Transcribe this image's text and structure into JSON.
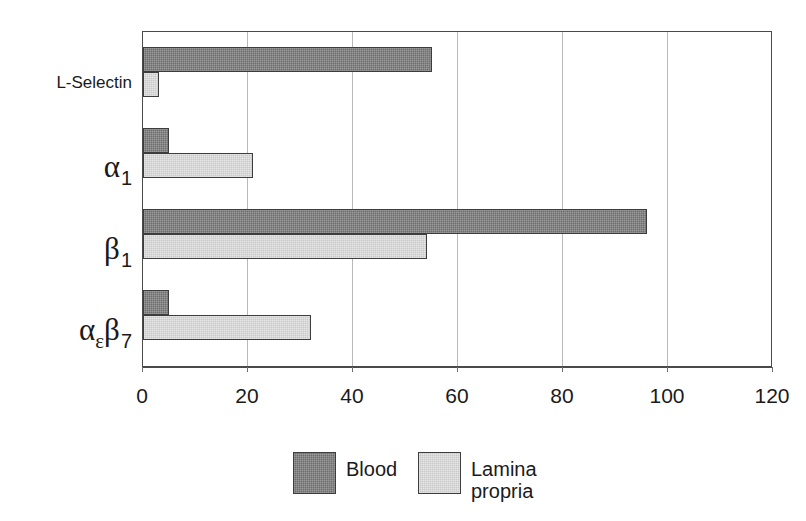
{
  "chart_data": {
    "type": "bar",
    "orientation": "horizontal",
    "title": "",
    "subtitle": "",
    "xlabel": "",
    "ylabel": "",
    "xlim": [
      0,
      120
    ],
    "xticks": [
      0,
      20,
      40,
      60,
      80,
      100,
      120
    ],
    "xtick_labels": [
      "0",
      "20",
      "40",
      "60",
      "80",
      "100",
      "120"
    ],
    "grid": "vertical",
    "legend_position": "bottom-center",
    "categories": [
      "L-Selectin",
      "α₁",
      "β₁",
      "αεβ₇"
    ],
    "category_labels_display": [
      {
        "base": "L-Selectin",
        "sub": "",
        "style": "plain"
      },
      {
        "base": "α",
        "sub": "1",
        "style": "greek"
      },
      {
        "base": "β",
        "sub": "1",
        "style": "greek"
      },
      {
        "base": "α",
        "sub": "ε",
        "base2": "β",
        "sub2": "7",
        "style": "greek-double"
      }
    ],
    "series": [
      {
        "name": "Blood",
        "color": "#6e6e6e",
        "values": [
          55,
          5,
          96,
          5
        ]
      },
      {
        "name": "Lamina propria",
        "color": "#c9c9c9",
        "values": [
          3,
          21,
          54,
          32
        ]
      }
    ]
  },
  "axis": {
    "tick_labels": [
      "0",
      "20",
      "40",
      "60",
      "80",
      "100",
      "120"
    ]
  },
  "legend": {
    "entries": [
      {
        "label": "Blood",
        "color": "#6e6e6e"
      },
      {
        "label": "Lamina\npropria",
        "color": "#c9c9c9"
      }
    ],
    "blood_label": "Blood",
    "lamina_label": "Lamina\npropria"
  },
  "categories": {
    "l_selectin": "L-Selectin",
    "alpha": "α",
    "beta": "β",
    "sub_one_a": "1",
    "sub_one_b": "1",
    "sub_epsilon": "ε",
    "sub_seven": "7"
  },
  "colors": {
    "blood": "#6e6e6e",
    "lamina_propria": "#c9c9c9",
    "axis": "#4a4a4a",
    "gridline": "#b9b9b9",
    "background": "#ffffff"
  }
}
